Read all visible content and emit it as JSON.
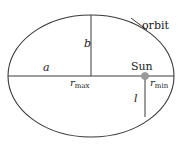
{
  "figure": {
    "background_color": "#ffffff",
    "stroke_color": "#3a3a3a",
    "text_color": "#1a1a1a",
    "sun_marker_color": "#9a9a9a"
  },
  "labels": {
    "orbit": "orbit",
    "semi_major": "a",
    "semi_minor": "b",
    "r_max_symbol": "r",
    "r_max_subscript": "max",
    "r_min_symbol": "r",
    "r_min_subscript": "min",
    "sun": "Sun",
    "semi_latus_rectum": "l"
  },
  "chart_data": {
    "type": "diagram",
    "shapes": [
      {
        "name": "orbit-ellipse",
        "kind": "ellipse",
        "cx": 91,
        "cy": 76,
        "rx": 83,
        "ry": 61
      },
      {
        "name": "major-axis-line",
        "kind": "line",
        "x1": 8,
        "y1": 76,
        "x2": 174,
        "y2": 76
      },
      {
        "name": "semi-minor-axis-line",
        "kind": "line",
        "x1": 91,
        "y1": 76,
        "x2": 91,
        "y2": 15
      },
      {
        "name": "semi-latus-rectum-line",
        "kind": "line",
        "x1": 145,
        "y1": 76,
        "x2": 145,
        "y2": 117
      },
      {
        "name": "orbit-leader-line",
        "kind": "line",
        "x1": 131,
        "y1": 18,
        "x2": 147,
        "y2": 30
      }
    ],
    "points": [
      {
        "name": "sun-focus",
        "x": 145,
        "y": 76,
        "radius": 3.6,
        "label": "Sun"
      }
    ],
    "annotations": [
      {
        "text": "orbit",
        "x": 158,
        "y": 27
      },
      {
        "text": "a",
        "x": 47,
        "y": 68
      },
      {
        "text": "b",
        "x": 87,
        "y": 44
      },
      {
        "text": "rmax",
        "x": 84,
        "y": 83
      },
      {
        "text": "Sun",
        "x": 142,
        "y": 67
      },
      {
        "text": "rmin",
        "x": 160,
        "y": 83
      },
      {
        "text": "l",
        "x": 137,
        "y": 99
      }
    ]
  }
}
